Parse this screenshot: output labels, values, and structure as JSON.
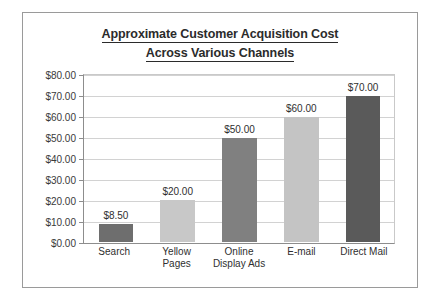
{
  "chart_data": {
    "type": "bar",
    "title": "Approximate Customer Acquisition Cost Across Various Channels",
    "title_line1": "Approximate Customer Acquisition Cost",
    "title_line2": "Across Various Channels",
    "xlabel": "",
    "ylabel": "",
    "ylim": [
      0,
      80
    ],
    "grid": true,
    "legend": "none",
    "categories": [
      "Search",
      "Yellow Pages",
      "Online Display Ads",
      "E-mail",
      "Direct Mail"
    ],
    "category_lines": [
      [
        "Search"
      ],
      [
        "Yellow",
        "Pages"
      ],
      [
        "Online",
        "Display Ads"
      ],
      [
        "E-mail"
      ],
      [
        "Direct Mail"
      ]
    ],
    "values": [
      8.5,
      20,
      50,
      60,
      70
    ],
    "value_labels": [
      "$8.50",
      "$20.00",
      "$50.00",
      "$60.00",
      "$70.00"
    ],
    "bar_colors": [
      "#6e6e6e",
      "#c8c8c8",
      "#808080",
      "#c4c4c4",
      "#5a5a5a"
    ],
    "ytick_values": [
      80,
      70,
      60,
      50,
      40,
      30,
      20,
      10,
      0
    ],
    "ytick_labels": [
      "$80.00",
      "$70.00",
      "$60.00",
      "$50.00",
      "$40.00",
      "$30.00",
      "$20.00",
      "$10.00",
      "$0.00"
    ]
  },
  "style": {
    "frame_color": "#9a9a9a",
    "axis_color": "#8d8d8d",
    "grid_color": "#d2d2d2",
    "text_color": "#2f2f2f",
    "background": "#ffffff"
  }
}
